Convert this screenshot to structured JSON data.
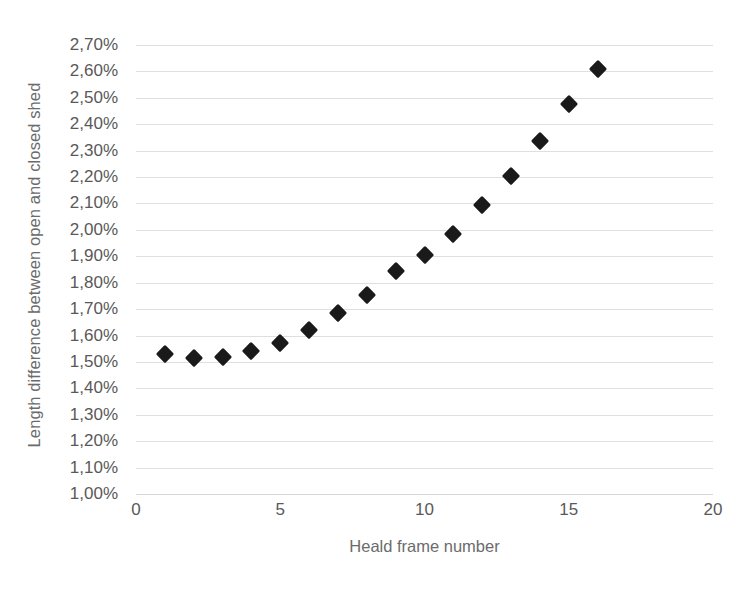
{
  "chart_data": {
    "type": "scatter",
    "title": "",
    "xlabel": "Heald frame number",
    "ylabel": "Length difference between open and closed shed",
    "xlim": [
      0,
      20
    ],
    "ylim": [
      1.0,
      2.7
    ],
    "grid": true,
    "legend": "none",
    "marker": "diamond",
    "marker_color": "#1a1a1a",
    "value_suffix": "%",
    "decimal_separator": ",",
    "x_ticks": [
      "0",
      "5",
      "10",
      "15",
      "20"
    ],
    "x_tick_values": [
      0,
      5,
      10,
      15,
      20
    ],
    "y_ticks": [
      "1,00%",
      "1,10%",
      "1,20%",
      "1,30%",
      "1,40%",
      "1,50%",
      "1,60%",
      "1,70%",
      "1,80%",
      "1,90%",
      "2,00%",
      "2,10%",
      "2,20%",
      "2,30%",
      "2,40%",
      "2,50%",
      "2,60%",
      "2,70%"
    ],
    "y_tick_values": [
      1.0,
      1.1,
      1.2,
      1.3,
      1.4,
      1.5,
      1.6,
      1.7,
      1.8,
      1.9,
      2.0,
      2.1,
      2.2,
      2.3,
      2.4,
      2.5,
      2.6,
      2.7
    ],
    "x": [
      1,
      2,
      3,
      4,
      5,
      6,
      7,
      8,
      9,
      10,
      11,
      12,
      13,
      14,
      15,
      16
    ],
    "values": [
      1.53,
      1.515,
      1.52,
      1.54,
      1.57,
      1.62,
      1.685,
      1.755,
      1.845,
      1.905,
      1.985,
      2.095,
      2.205,
      2.335,
      2.475,
      2.61
    ],
    "point_labels": [
      "1,53%",
      "1,52%",
      "1,52%",
      "1,54%",
      "1,57%",
      "1,62%",
      "1,69%",
      "1,76%",
      "1,85%",
      "1,91%",
      "1,99%",
      "2,10%",
      "2,21%",
      "2,34%",
      "2,48%",
      "2,61%"
    ]
  },
  "axes": {
    "x_title": "Heald frame number",
    "y_title": "Length difference between open and closed shed"
  },
  "caption": {
    "bottom_cropped_text": ""
  }
}
